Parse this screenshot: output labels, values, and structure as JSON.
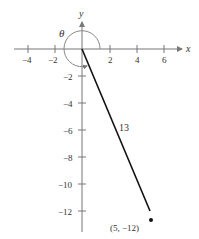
{
  "diagram": {
    "x_axis_label": "x",
    "y_axis_label": "y",
    "angle_label": "θ",
    "segment_label": "13",
    "point_label": "(5, −12)",
    "x_ticks": [
      {
        "value": -4,
        "label": "−4"
      },
      {
        "value": -2,
        "label": "−2"
      },
      {
        "value": 2,
        "label": "2"
      },
      {
        "value": 4,
        "label": "4"
      },
      {
        "value": 6,
        "label": "6"
      }
    ],
    "y_ticks": [
      {
        "value": -2,
        "label": "−2"
      },
      {
        "value": -4,
        "label": "−4"
      },
      {
        "value": -6,
        "label": "−6"
      },
      {
        "value": -8,
        "label": "−8"
      },
      {
        "value": -10,
        "label": "−10"
      },
      {
        "value": -12,
        "label": "−12"
      }
    ],
    "point": {
      "x": 5,
      "y": -12
    },
    "colors": {
      "axis": "#777777",
      "segment": "#111111",
      "arc": "#888888"
    }
  }
}
